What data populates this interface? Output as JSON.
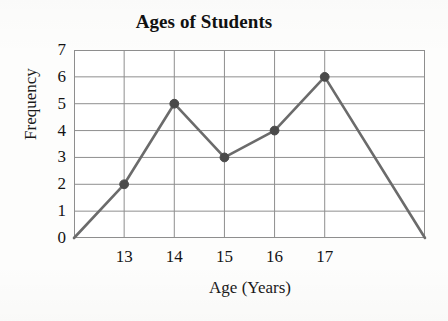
{
  "figure": {
    "background_color": "#fdfdfc",
    "frame_color": "#8e8e8e"
  },
  "chart_data": {
    "type": "line",
    "title": "Ages of Students",
    "xlabel": "Age (Years)",
    "ylabel": "Frequency",
    "x": [
      13,
      14,
      15,
      16,
      17
    ],
    "categories": [
      "13",
      "14",
      "15",
      "16",
      "17"
    ],
    "values": [
      2,
      5,
      3,
      4,
      6
    ],
    "series": [
      {
        "name": "Frequency",
        "values": [
          2,
          5,
          3,
          4,
          6
        ],
        "line_color": "#6b6b6b",
        "marker_color": "#4a4a4a",
        "marker": "circle"
      }
    ],
    "xlim": [
      12,
      19
    ],
    "ylim": [
      0,
      7
    ],
    "x_tick_labels": [
      "13",
      "14",
      "15",
      "16",
      "17"
    ],
    "y_tick_labels": [
      "0",
      "1",
      "2",
      "3",
      "4",
      "5",
      "6",
      "7"
    ],
    "y_ticks": [
      0,
      1,
      2,
      3,
      4,
      5,
      6,
      7
    ],
    "grid": "both",
    "legend": "none",
    "endpoints_note": "Polygon closes to zero at x=12 and x=19 with no markers",
    "closing_points": [
      {
        "x": 12,
        "y": 0
      },
      {
        "x": 19,
        "y": 0
      }
    ]
  }
}
